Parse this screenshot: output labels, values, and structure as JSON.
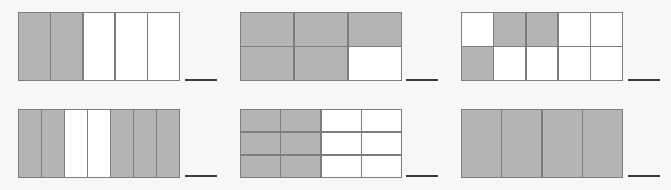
{
  "worksheet": {
    "colors": {
      "background": "#f7f7f7",
      "shaded": "#b4b4b4",
      "unshaded": "#ffffff",
      "border": "#7d7d7d",
      "answer_line": "#3a3a3a"
    },
    "figures": [
      {
        "id": "figure-1",
        "cols": 5,
        "rows": 1,
        "shaded": [
          [
            1,
            1,
            0,
            0,
            0
          ]
        ],
        "box": {
          "x": 18,
          "y": 12,
          "w": 162,
          "h": 69
        },
        "line": {
          "x": 185,
          "y": 79,
          "w": 32
        }
      },
      {
        "id": "figure-2",
        "cols": 3,
        "rows": 2,
        "shaded": [
          [
            1,
            1,
            1
          ],
          [
            1,
            1,
            0
          ]
        ],
        "box": {
          "x": 240,
          "y": 12,
          "w": 162,
          "h": 69
        },
        "line": {
          "x": 406,
          "y": 79,
          "w": 32
        }
      },
      {
        "id": "figure-3",
        "cols": 5,
        "rows": 2,
        "shaded": [
          [
            0,
            1,
            1,
            0,
            0
          ],
          [
            1,
            0,
            0,
            0,
            0
          ]
        ],
        "box": {
          "x": 461,
          "y": 12,
          "w": 162,
          "h": 69
        },
        "line": {
          "x": 628,
          "y": 79,
          "w": 32
        }
      },
      {
        "id": "figure-4",
        "cols": 7,
        "rows": 1,
        "shaded": [
          [
            1,
            1,
            0,
            0,
            1,
            1,
            1
          ]
        ],
        "box": {
          "x": 18,
          "y": 109,
          "w": 162,
          "h": 69
        },
        "line": {
          "x": 185,
          "y": 175,
          "w": 32
        }
      },
      {
        "id": "figure-5",
        "cols": 4,
        "rows": 3,
        "shaded": [
          [
            1,
            1,
            0,
            0
          ],
          [
            1,
            1,
            0,
            0
          ],
          [
            1,
            1,
            0,
            0
          ]
        ],
        "box": {
          "x": 240,
          "y": 109,
          "w": 162,
          "h": 69
        },
        "line": {
          "x": 406,
          "y": 175,
          "w": 32
        }
      },
      {
        "id": "figure-6",
        "cols": 4,
        "rows": 1,
        "shaded": [
          [
            1,
            1,
            1,
            1
          ]
        ],
        "box": {
          "x": 461,
          "y": 109,
          "w": 162,
          "h": 69
        },
        "line": {
          "x": 628,
          "y": 175,
          "w": 32
        }
      }
    ],
    "answers": [
      "",
      "",
      "",
      "",
      "",
      ""
    ]
  }
}
